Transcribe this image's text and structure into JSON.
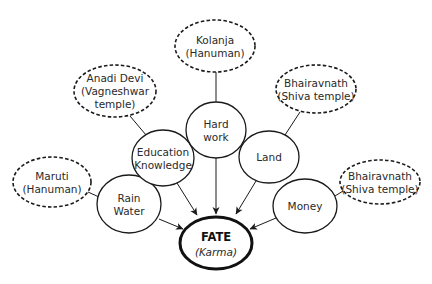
{
  "diagram": {
    "type": "concept-map",
    "center": {
      "id": "fate",
      "title": "FATE",
      "subtitle": "(Karma)",
      "cx": 216,
      "cy": 243,
      "rx": 36,
      "ry": 26
    },
    "factors": [
      {
        "id": "rain-water",
        "lines": [
          "Rain",
          "Water"
        ],
        "cx": 129,
        "cy": 204,
        "rx": 32,
        "ry": 29
      },
      {
        "id": "education-knowledge",
        "lines": [
          "Education",
          "Knowledge"
        ],
        "cx": 163,
        "cy": 158,
        "rx": 31,
        "ry": 28
      },
      {
        "id": "hard-work",
        "lines": [
          "Hard",
          "work"
        ],
        "cx": 216,
        "cy": 130,
        "rx": 30,
        "ry": 28
      },
      {
        "id": "land",
        "lines": [
          "Land"
        ],
        "cx": 269,
        "cy": 157,
        "rx": 30,
        "ry": 26
      },
      {
        "id": "money",
        "lines": [
          "Money"
        ],
        "cx": 305,
        "cy": 206,
        "rx": 32,
        "ry": 27
      }
    ],
    "deities": [
      {
        "id": "maruti",
        "lines": [
          "Maruti",
          "(Hanuman)"
        ],
        "cx": 52,
        "cy": 182,
        "rx": 39,
        "ry": 25,
        "linked_to": "rain-water"
      },
      {
        "id": "anadi-devi",
        "lines": [
          "Anadi Devi",
          "(Vagneshwar",
          "temple)"
        ],
        "cx": 115,
        "cy": 91,
        "rx": 41,
        "ry": 26,
        "linked_to": "education-knowledge"
      },
      {
        "id": "kolanja",
        "lines": [
          "Kolanja",
          "(Hanuman)"
        ],
        "cx": 215,
        "cy": 46,
        "rx": 40,
        "ry": 26,
        "linked_to": "hard-work"
      },
      {
        "id": "bhairavnath-top",
        "lines": [
          "Bhairavnath",
          "(Shiva temple)"
        ],
        "cx": 316,
        "cy": 89,
        "rx": 40,
        "ry": 24,
        "linked_to": "land"
      },
      {
        "id": "bhairavnath-right",
        "lines": [
          "Bhairavnath",
          "(Shiva temple)"
        ],
        "cx": 380,
        "cy": 182,
        "rx": 40,
        "ry": 22,
        "linked_to": "money"
      }
    ],
    "arrows": [
      {
        "from": "rain-water",
        "to": "fate",
        "x1": 159,
        "y1": 219,
        "x2": 183,
        "y2": 229
      },
      {
        "from": "education-knowledge",
        "to": "fate",
        "x1": 177,
        "y1": 183,
        "x2": 197,
        "y2": 215
      },
      {
        "from": "hard-work",
        "to": "fate",
        "x1": 216,
        "y1": 158,
        "x2": 216,
        "y2": 214
      },
      {
        "from": "land",
        "to": "fate",
        "x1": 256,
        "y1": 181,
        "x2": 236,
        "y2": 214
      },
      {
        "from": "money",
        "to": "fate",
        "x1": 276,
        "y1": 218,
        "x2": 250,
        "y2": 229
      }
    ],
    "links": [
      {
        "from": "maruti",
        "to": "rain-water",
        "x1": 88,
        "y1": 192,
        "x2": 99,
        "y2": 197
      },
      {
        "from": "anadi-devi",
        "to": "education-knowledge",
        "x1": 130,
        "y1": 116,
        "x2": 146,
        "y2": 135
      },
      {
        "from": "kolanja",
        "to": "hard-work",
        "x1": 216,
        "y1": 72,
        "x2": 216,
        "y2": 102
      },
      {
        "from": "bhairavnath-top",
        "to": "land",
        "x1": 300,
        "y1": 112,
        "x2": 285,
        "y2": 135
      },
      {
        "from": "bhairavnath-right",
        "to": "money",
        "x1": 343,
        "y1": 191,
        "x2": 335,
        "y2": 196
      }
    ],
    "colors": {
      "stroke": "#1a1a1a",
      "text": "#2a2a2a",
      "background": "#ffffff"
    }
  }
}
